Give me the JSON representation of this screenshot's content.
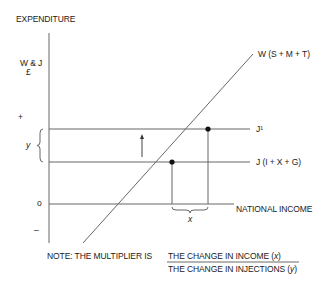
{
  "diagram": {
    "y_axis_title": "EXPENDITURE",
    "y_axis_label_line1": "W & J",
    "y_axis_label_line2": "£",
    "plus_marker": "+",
    "zero_marker": "o",
    "minus_marker": "–",
    "y_brace_label": "y",
    "x_brace_label": "x",
    "line_w_label": "W (S + M + T)",
    "line_j1_label": "J¹",
    "line_j_label": "J (I + X + G)",
    "x_axis_label": "NATIONAL INCOME",
    "note_prefix": "NOTE: THE MULTIPLIER IS",
    "numerator_text": "THE CHANGE IN INCOME (",
    "numerator_var": "x",
    "denominator_text": "THE CHANGE IN INJECTIONS (",
    "denominator_var": "y",
    "close_paren": ")",
    "line_color": "#555555",
    "point_color": "#111111"
  }
}
